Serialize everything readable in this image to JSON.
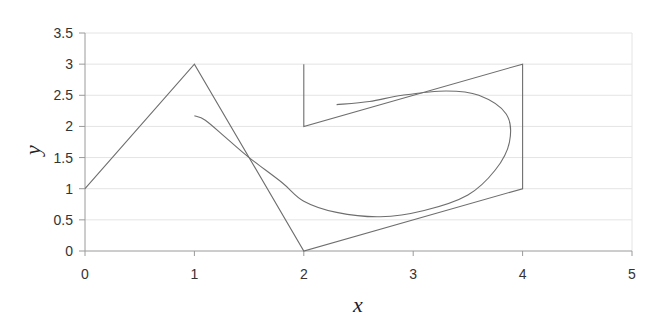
{
  "chart_data": {
    "type": "line",
    "title": "",
    "xlabel": "x",
    "ylabel": "y",
    "xlim": [
      0,
      5
    ],
    "ylim": [
      0,
      3.5
    ],
    "x_ticks": [
      "0",
      "1",
      "2",
      "3",
      "4",
      "5"
    ],
    "y_ticks": [
      "0",
      "0.5",
      "1",
      "1.5",
      "2",
      "2.5",
      "3",
      "3.5"
    ],
    "grid": {
      "horizontal": "faint",
      "vertical": false
    },
    "legend": null,
    "series": [
      {
        "name": "control polygon",
        "style": "straight line",
        "points": [
          [
            0,
            1
          ],
          [
            1,
            3
          ],
          [
            2,
            0
          ],
          [
            4,
            1
          ],
          [
            4,
            3
          ],
          [
            2,
            2
          ],
          [
            2,
            3
          ]
        ]
      },
      {
        "name": "curve",
        "style": "smooth line",
        "points": [
          [
            1.0,
            2.17
          ],
          [
            1.1,
            2.1
          ],
          [
            1.3,
            1.8
          ],
          [
            1.5,
            1.5
          ],
          [
            1.8,
            1.1
          ],
          [
            2.0,
            0.8
          ],
          [
            2.3,
            0.62
          ],
          [
            2.7,
            0.55
          ],
          [
            3.1,
            0.65
          ],
          [
            3.5,
            0.9
          ],
          [
            3.75,
            1.3
          ],
          [
            3.88,
            1.75
          ],
          [
            3.85,
            2.2
          ],
          [
            3.6,
            2.5
          ],
          [
            3.3,
            2.57
          ],
          [
            2.9,
            2.5
          ],
          [
            2.6,
            2.4
          ],
          [
            2.3,
            2.35
          ]
        ]
      }
    ]
  },
  "colors": {
    "line": "#6e6e6e",
    "axis": "#9a9a9a",
    "grid": "#e4e4e4",
    "text": "#333333"
  }
}
